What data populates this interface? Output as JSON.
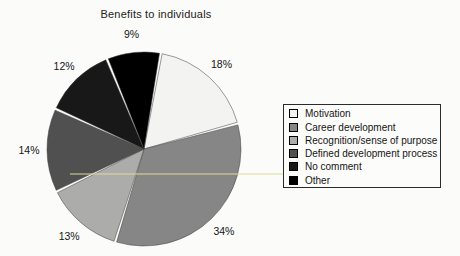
{
  "chart_data": {
    "type": "pie",
    "title": "Benefits to individuals",
    "categories": [
      "Motivation",
      "Career development",
      "Recognition/sense of purpose",
      "Defined development process",
      "No comment",
      "Other"
    ],
    "values": [
      18,
      34,
      13,
      14,
      12,
      9
    ],
    "labels": [
      "18%",
      "34%",
      "13%",
      "14%",
      "12%",
      "9%"
    ],
    "colors": [
      "#f3f3f1",
      "#868686",
      "#acacaa",
      "#505050",
      "#181818",
      "#000000"
    ],
    "start_angle_deg": 10,
    "direction": "clockwise",
    "legend_position": "right",
    "slice_outline_color": "#3a3a3a",
    "gap_color": "#fbfbfa"
  }
}
